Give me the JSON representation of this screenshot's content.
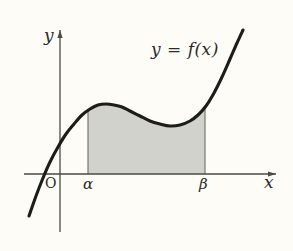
{
  "figure": {
    "kind": "calculus-definite-integral-diagram",
    "background_color": "#fdfcf6",
    "curve_color": "#1c1c1a",
    "axis_color": "#4a4a46",
    "shade_color": "#d2d2cc",
    "labels": {
      "curve": "y = f(x)",
      "y_axis": "y",
      "x_axis": "x",
      "origin": "O",
      "lower_limit": "α",
      "upper_limit": "β"
    }
  },
  "chart_data": {
    "type": "line",
    "title": "",
    "subtitle": "",
    "xlabel": "x",
    "ylabel": "y",
    "grid": false,
    "legend": null,
    "annotations": [
      {
        "text": "y = f(x)",
        "x_px": 151,
        "y_px": 41
      },
      {
        "text": "O",
        "x_px": 45,
        "y_px": 176
      },
      {
        "text": "α",
        "x_px": 83,
        "y_px": 177
      },
      {
        "text": "β",
        "x_px": 199,
        "y_px": 177
      }
    ],
    "axes": {
      "x_axis_y_px": 174,
      "y_axis_x_px": 60,
      "x_axis_from_px": 24,
      "x_axis_to_px": 276,
      "y_axis_from_px": 30,
      "y_axis_to_px": 232,
      "x_arrow": true,
      "y_arrow": true
    },
    "series": [
      {
        "name": "y = f(x)",
        "comment": "cubic-like curve, pixel coordinates left-to-right",
        "points_px": [
          [
            29,
            216
          ],
          [
            36,
            196
          ],
          [
            43,
            178
          ],
          [
            50,
            162
          ],
          [
            58,
            147
          ],
          [
            66,
            134
          ],
          [
            74,
            124
          ],
          [
            82,
            115
          ],
          [
            90,
            109
          ],
          [
            98,
            105
          ],
          [
            106,
            104
          ],
          [
            114,
            105
          ],
          [
            122,
            107
          ],
          [
            130,
            111
          ],
          [
            140,
            116
          ],
          [
            150,
            121
          ],
          [
            160,
            124
          ],
          [
            170,
            126
          ],
          [
            180,
            125
          ],
          [
            190,
            121
          ],
          [
            198,
            115
          ],
          [
            206,
            106
          ],
          [
            214,
            93
          ],
          [
            222,
            77
          ],
          [
            230,
            59
          ],
          [
            237,
            43
          ],
          [
            243,
            30
          ]
        ]
      }
    ],
    "shaded_region": {
      "label": "area under f from alpha to beta",
      "x_from_px": 88,
      "x_to_px": 205,
      "baseline_y_px": 174,
      "fill": "#d2d2cc"
    },
    "marks": {
      "alpha_x_px": 88,
      "beta_x_px": 205,
      "local_max_px": [
        104,
        104
      ],
      "local_min_px": [
        172,
        126
      ],
      "x_intercept_px": 41
    }
  }
}
